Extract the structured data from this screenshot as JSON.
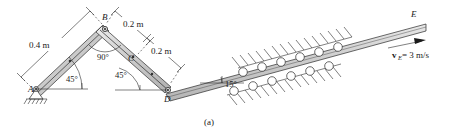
{
  "figure": {
    "caption": "(a)"
  },
  "points": [
    {
      "id": "A",
      "label": "A",
      "x": 36,
      "y": 88,
      "kind": "pin-support"
    },
    {
      "id": "B",
      "label": "B",
      "x": 105,
      "y": 28,
      "kind": "pin-joint"
    },
    {
      "id": "C",
      "label": "C",
      "x": 136,
      "y": 57,
      "kind": "midpoint-mark"
    },
    {
      "id": "D",
      "label": "D",
      "x": 168,
      "y": 89,
      "kind": "pin-joint"
    },
    {
      "id": "E",
      "label": "E",
      "x": 424,
      "y": 26,
      "kind": "bar-end"
    }
  ],
  "dimensions": [
    {
      "id": "AB",
      "label": "0.4 m",
      "x": 43,
      "y": 46
    },
    {
      "id": "BC",
      "label": "0.2 m",
      "x": 137,
      "y": 26
    },
    {
      "id": "CD",
      "label": "0.2 m",
      "x": 164,
      "y": 53
    }
  ],
  "angles": [
    {
      "id": "angle-at-B",
      "label": "90°",
      "x": 104,
      "y": 58
    },
    {
      "id": "angle-at-A",
      "label": "45°",
      "x": 73,
      "y": 80
    },
    {
      "id": "angle-at-C",
      "label": "45°",
      "x": 122,
      "y": 76
    },
    {
      "id": "angle-at-D",
      "label": "15°",
      "x": 227,
      "y": 88
    }
  ],
  "velocity": {
    "symbol": "v",
    "subscript": "E",
    "equals_value": " = 3 m/s",
    "full_text": "vE = 3 m/s",
    "x": 398,
    "y": 56
  },
  "colors": {
    "bar_fill": "#c9c9c9",
    "bar_fill_light": "#dedede",
    "outline": "#2b2b2b",
    "background": "#ffffff",
    "text": "#1a1a1a"
  },
  "rollers": {
    "count_top": 6,
    "count_bottom": 6,
    "description": "guide-rollers"
  }
}
